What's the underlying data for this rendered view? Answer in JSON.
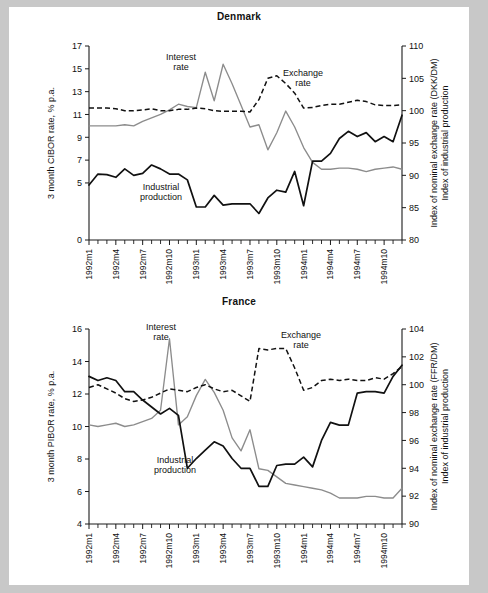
{
  "page": {
    "background_color": "#c8c8c8",
    "paper_color": "#ffffff"
  },
  "panels": [
    {
      "id": "denmark",
      "title": "Denmark"
    },
    {
      "id": "france",
      "title": "France"
    }
  ],
  "annotations": {
    "interest_line1": "Interest",
    "interest_line2": "rate",
    "exchange_line1": "Exchange",
    "exchange_line2": "rate",
    "industrial_line1": "Industrial",
    "industrial_line2": "production"
  },
  "colors": {
    "interest_rate": "#8c8c8c",
    "industrial_production": "#111111",
    "exchange_rate": "#111111",
    "axis": "#1a1a1a"
  },
  "chart_data": [
    {
      "type": "line",
      "title": "Denmark",
      "xlabel": "",
      "ylabel": "3 month CIBOR rate, % p.a.",
      "y2label_line1": "Index of nominal exchange rate (DKK/DM)",
      "y2label_line2": "Index of industrial production",
      "ylim": [
        0,
        17
      ],
      "yticks": [
        0,
        5,
        7,
        9,
        11,
        13,
        15,
        17
      ],
      "y2lim": [
        80,
        110
      ],
      "y2ticks": [
        80,
        85,
        90,
        95,
        100,
        105,
        110
      ],
      "grid": false,
      "legend": "inline-annotations",
      "x": [
        "1992m1",
        "1992m2",
        "1992m3",
        "1992m4",
        "1992m5",
        "1992m6",
        "1992m7",
        "1992m8",
        "1992m9",
        "1992m10",
        "1992m11",
        "1992m12",
        "1993m1",
        "1993m2",
        "1993m3",
        "1993m4",
        "1993m5",
        "1993m6",
        "1993m7",
        "1993m8",
        "1993m9",
        "1993m10",
        "1993m11",
        "1993m12",
        "1994m1",
        "1994m2",
        "1994m3",
        "1994m4",
        "1994m5",
        "1994m6",
        "1994m7",
        "1994m8",
        "1994m9",
        "1994m10",
        "1994m11",
        "1994m12"
      ],
      "xtick_labels": [
        "1992m1",
        "1992m4",
        "1992m7",
        "1992m10",
        "1993m1",
        "1993m4",
        "1993m7",
        "1993m10",
        "1994m1",
        "1994m4",
        "1994m7",
        "1994m10"
      ],
      "xtick_indices": [
        0,
        3,
        6,
        9,
        12,
        15,
        18,
        21,
        24,
        27,
        30,
        33
      ],
      "series": [
        {
          "name": "Interest rate",
          "axis": "left",
          "units": "3 month CIBOR rate, % p.a.",
          "color": "#8c8c8c",
          "style": "solid-gray",
          "values": [
            10.0,
            10.0,
            10.0,
            10.0,
            10.1,
            10.0,
            10.4,
            10.7,
            11.0,
            11.4,
            11.9,
            11.7,
            11.6,
            14.7,
            12.2,
            15.4,
            13.7,
            11.8,
            9.9,
            10.1,
            7.9,
            9.4,
            11.3,
            9.9,
            8.1,
            6.8,
            6.2,
            6.2,
            6.3,
            6.3,
            6.2,
            6.0,
            6.2,
            6.3,
            6.4,
            6.2
          ]
        },
        {
          "name": "Industrial production",
          "axis": "right",
          "units": "Index of industrial production",
          "color": "#111111",
          "style": "solid-black",
          "values": [
            88.5,
            90.2,
            90.1,
            89.7,
            91.0,
            90.0,
            90.3,
            91.6,
            91.0,
            90.2,
            90.2,
            89.3,
            85.1,
            85.1,
            86.9,
            85.4,
            85.6,
            85.6,
            85.6,
            84.1,
            86.5,
            87.7,
            87.4,
            90.6,
            85.3,
            92.2,
            92.2,
            93.4,
            95.7,
            96.8,
            96.0,
            96.6,
            95.2,
            96.0,
            95.2,
            99.3
          ]
        },
        {
          "name": "Exchange rate",
          "axis": "right",
          "units": "Index of nominal exchange rate (DKK/DM)",
          "color": "#111111",
          "style": "dashed",
          "values": [
            100.4,
            100.4,
            100.4,
            100.3,
            100.0,
            100.0,
            100.1,
            100.3,
            100.0,
            100.0,
            100.2,
            100.2,
            100.4,
            100.3,
            100.0,
            99.9,
            99.9,
            99.9,
            99.8,
            101.7,
            105.0,
            105.4,
            104.2,
            102.7,
            100.4,
            100.5,
            100.8,
            101.0,
            101.0,
            101.3,
            101.6,
            101.4,
            100.9,
            100.8,
            100.8,
            100.9
          ]
        }
      ]
    },
    {
      "type": "line",
      "title": "France",
      "xlabel": "",
      "ylabel": "3 month PIBOR rate, % p.a.",
      "y2label_line1": "Index of nominal exchange rate (FFR/DM)",
      "y2label_line2": "Index of industrial production",
      "ylim": [
        4,
        16
      ],
      "yticks": [
        4,
        6,
        8,
        10,
        12,
        14,
        16
      ],
      "y2lim": [
        90,
        104
      ],
      "y2ticks": [
        90,
        92,
        94,
        96,
        98,
        100,
        102,
        104
      ],
      "grid": false,
      "legend": "inline-annotations",
      "x": [
        "1992m1",
        "1992m2",
        "1992m3",
        "1992m4",
        "1992m5",
        "1992m6",
        "1992m7",
        "1992m8",
        "1992m9",
        "1992m10",
        "1992m11",
        "1992m12",
        "1993m1",
        "1993m2",
        "1993m3",
        "1993m4",
        "1993m5",
        "1993m6",
        "1993m7",
        "1993m8",
        "1993m9",
        "1993m10",
        "1993m11",
        "1993m12",
        "1994m1",
        "1994m2",
        "1994m3",
        "1994m4",
        "1994m5",
        "1994m6",
        "1994m7",
        "1994m8",
        "1994m9",
        "1994m10",
        "1994m11",
        "1994m12"
      ],
      "xtick_labels": [
        "1992m1",
        "1992m4",
        "1992m7",
        "1992m10",
        "1993m1",
        "1993m4",
        "1993m7",
        "1993m10",
        "1994m1",
        "1994m4",
        "1994m7",
        "1994m10"
      ],
      "xtick_indices": [
        0,
        3,
        6,
        9,
        12,
        15,
        18,
        21,
        24,
        27,
        30,
        33
      ],
      "series": [
        {
          "name": "Interest rate",
          "axis": "left",
          "units": "3 month PIBOR rate, % p.a.",
          "color": "#8c8c8c",
          "style": "solid-gray",
          "values": [
            10.1,
            10.0,
            10.1,
            10.2,
            10.0,
            10.1,
            10.3,
            10.5,
            11.0,
            15.4,
            10.1,
            10.6,
            11.9,
            12.9,
            12.1,
            11.0,
            9.3,
            8.5,
            9.8,
            7.4,
            7.3,
            6.9,
            6.5,
            6.4,
            6.3,
            6.2,
            6.1,
            5.9,
            5.6,
            5.6,
            5.6,
            5.7,
            5.7,
            5.6,
            5.6,
            6.2
          ]
        },
        {
          "name": "Industrial production",
          "axis": "right",
          "units": "Index of industrial production",
          "color": "#111111",
          "style": "solid-black",
          "values": [
            100.6,
            100.3,
            100.5,
            100.3,
            99.5,
            99.5,
            98.9,
            98.4,
            97.9,
            98.3,
            97.8,
            94.0,
            94.7,
            95.3,
            95.9,
            95.6,
            94.7,
            94.0,
            94.0,
            92.7,
            92.7,
            94.2,
            94.3,
            94.3,
            94.8,
            94.1,
            96.0,
            97.3,
            97.1,
            97.1,
            99.4,
            99.5,
            99.5,
            99.4,
            100.6,
            101.4
          ]
        },
        {
          "name": "Exchange rate",
          "axis": "right",
          "units": "Index of nominal exchange rate (FFR/DM)",
          "color": "#111111",
          "style": "dashed",
          "values": [
            99.8,
            100.0,
            99.7,
            99.4,
            99.0,
            98.8,
            98.9,
            99.1,
            99.4,
            99.7,
            99.6,
            99.5,
            99.8,
            100.0,
            99.7,
            99.5,
            99.6,
            99.2,
            98.8,
            102.6,
            102.5,
            102.6,
            102.6,
            101.2,
            99.6,
            99.8,
            100.3,
            100.4,
            100.3,
            100.4,
            100.3,
            100.3,
            100.5,
            100.4,
            100.8,
            101.3
          ]
        }
      ]
    }
  ]
}
